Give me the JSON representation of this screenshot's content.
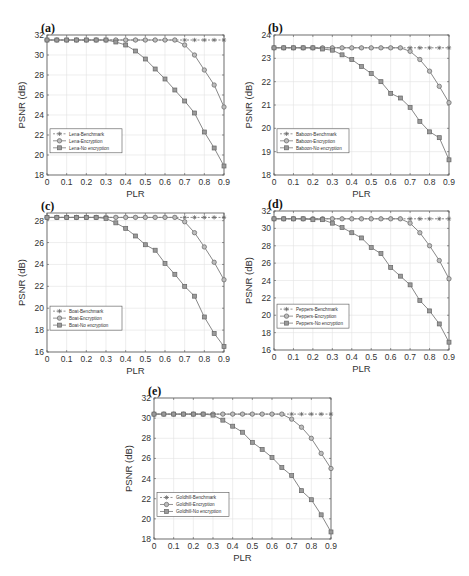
{
  "figure": {
    "xlabel": "PLR",
    "ylabel": "PSNR (dB)"
  },
  "chart_data": [
    {
      "panel": "(a)",
      "type": "line",
      "xlabel": "PLR",
      "ylabel": "PSNR (dB)",
      "x": [
        0,
        0.05,
        0.1,
        0.15,
        0.2,
        0.25,
        0.3,
        0.35,
        0.4,
        0.45,
        0.5,
        0.55,
        0.6,
        0.65,
        0.7,
        0.75,
        0.8,
        0.85,
        0.9
      ],
      "xticks": [
        "0",
        "0.1",
        "0.2",
        "0.3",
        "0.4",
        "0.5",
        "0.6",
        "0.7",
        "0.8",
        "0.9"
      ],
      "xlim": [
        0,
        0.9
      ],
      "ylim": [
        18,
        32
      ],
      "yticks": [
        18,
        20,
        22,
        24,
        26,
        28,
        30,
        32
      ],
      "grid": true,
      "legend_position": "lower left",
      "series": [
        {
          "name": "Lena-Benchmark",
          "marker": "star",
          "values": [
            31.5,
            31.5,
            31.5,
            31.5,
            31.5,
            31.5,
            31.5,
            31.5,
            31.5,
            31.5,
            31.5,
            31.5,
            31.5,
            31.5,
            31.5,
            31.5,
            31.5,
            31.5,
            31.5
          ]
        },
        {
          "name": "Lena-Encryption",
          "marker": "circle",
          "values": [
            31.5,
            31.5,
            31.5,
            31.5,
            31.5,
            31.5,
            31.5,
            31.5,
            31.5,
            31.5,
            31.5,
            31.5,
            31.5,
            31.5,
            31.0,
            30.0,
            28.5,
            27.0,
            24.8
          ]
        },
        {
          "name": "Lena-No encryption",
          "marker": "square",
          "values": [
            31.5,
            31.5,
            31.5,
            31.5,
            31.5,
            31.5,
            31.5,
            31.3,
            31.0,
            30.4,
            29.6,
            28.6,
            27.6,
            26.5,
            25.4,
            24.2,
            22.3,
            20.7,
            18.9
          ]
        }
      ]
    },
    {
      "panel": "(b)",
      "type": "line",
      "xlabel": "PLR",
      "ylabel": "PSNR (dB)",
      "x": [
        0,
        0.05,
        0.1,
        0.15,
        0.2,
        0.25,
        0.3,
        0.35,
        0.4,
        0.45,
        0.5,
        0.55,
        0.6,
        0.65,
        0.7,
        0.75,
        0.8,
        0.85,
        0.9
      ],
      "xticks": [
        "0",
        "0.1",
        "0.2",
        "0.3",
        "0.4",
        "0.5",
        "0.6",
        "0.7",
        "0.8",
        "0.9"
      ],
      "xlim": [
        0,
        0.9
      ],
      "ylim": [
        18,
        24
      ],
      "yticks": [
        18,
        19,
        20,
        21,
        22,
        23,
        24
      ],
      "grid": true,
      "legend_position": "lower left",
      "series": [
        {
          "name": "Baboon-Benchmark",
          "marker": "star",
          "values": [
            23.45,
            23.45,
            23.45,
            23.45,
            23.45,
            23.45,
            23.45,
            23.45,
            23.45,
            23.45,
            23.45,
            23.45,
            23.45,
            23.45,
            23.45,
            23.45,
            23.45,
            23.45,
            23.45
          ]
        },
        {
          "name": "Baboon-Encryption",
          "marker": "circle",
          "values": [
            23.45,
            23.45,
            23.45,
            23.45,
            23.45,
            23.45,
            23.45,
            23.45,
            23.45,
            23.45,
            23.45,
            23.45,
            23.45,
            23.45,
            23.3,
            22.95,
            22.45,
            21.8,
            21.1
          ]
        },
        {
          "name": "Baboon-No encryption",
          "marker": "square",
          "values": [
            23.45,
            23.45,
            23.45,
            23.45,
            23.45,
            23.4,
            23.35,
            23.15,
            22.95,
            22.65,
            22.35,
            22.0,
            21.5,
            21.3,
            20.9,
            20.3,
            19.85,
            19.6,
            18.65
          ]
        }
      ]
    },
    {
      "panel": "(c)",
      "type": "line",
      "xlabel": "PLR",
      "ylabel": "PSNR (dB)",
      "x": [
        0,
        0.05,
        0.1,
        0.15,
        0.2,
        0.25,
        0.3,
        0.35,
        0.4,
        0.45,
        0.5,
        0.55,
        0.6,
        0.65,
        0.7,
        0.75,
        0.8,
        0.85,
        0.9
      ],
      "xticks": [
        "0",
        "0.1",
        "0.2",
        "0.3",
        "0.4",
        "0.5",
        "0.6",
        "0.7",
        "0.8",
        "0.9"
      ],
      "xlim": [
        0,
        0.9
      ],
      "ylim": [
        16,
        28.7
      ],
      "yticks": [
        16,
        18,
        20,
        22,
        24,
        26,
        28
      ],
      "grid": true,
      "legend_position": "lower left",
      "series": [
        {
          "name": "Boat-Benchmark",
          "marker": "star",
          "values": [
            28.3,
            28.3,
            28.3,
            28.3,
            28.3,
            28.3,
            28.3,
            28.3,
            28.3,
            28.3,
            28.3,
            28.3,
            28.3,
            28.3,
            28.3,
            28.3,
            28.3,
            28.3,
            28.3
          ]
        },
        {
          "name": "Boat-Encryption",
          "marker": "circle",
          "values": [
            28.3,
            28.3,
            28.3,
            28.3,
            28.3,
            28.3,
            28.3,
            28.3,
            28.3,
            28.3,
            28.3,
            28.3,
            28.3,
            28.3,
            27.9,
            26.9,
            25.6,
            24.2,
            22.6
          ]
        },
        {
          "name": "Boat-No encryption",
          "marker": "square",
          "values": [
            28.3,
            28.3,
            28.3,
            28.3,
            28.3,
            28.3,
            28.2,
            27.8,
            27.3,
            26.6,
            25.8,
            25.3,
            24.1,
            23.1,
            22.0,
            21.1,
            19.2,
            17.7,
            16.5
          ]
        }
      ]
    },
    {
      "panel": "(d)",
      "type": "line",
      "xlabel": "PLR",
      "ylabel": "PSNR (dB)",
      "x": [
        0,
        0.05,
        0.1,
        0.15,
        0.2,
        0.25,
        0.3,
        0.35,
        0.4,
        0.45,
        0.5,
        0.55,
        0.6,
        0.65,
        0.7,
        0.75,
        0.8,
        0.85,
        0.9
      ],
      "xticks": [
        "0",
        "0.1",
        "0.2",
        "0.3",
        "0.4",
        "0.5",
        "0.6",
        "0.7",
        "0.8",
        "0.9"
      ],
      "xlim": [
        0,
        0.9
      ],
      "ylim": [
        16,
        32
      ],
      "yticks": [
        16,
        18,
        20,
        22,
        24,
        26,
        28,
        30,
        32
      ],
      "grid": true,
      "legend_position": "lower left",
      "series": [
        {
          "name": "Peppers-Benchmark",
          "marker": "star",
          "values": [
            31.1,
            31.1,
            31.1,
            31.1,
            31.1,
            31.1,
            31.1,
            31.1,
            31.1,
            31.1,
            31.1,
            31.1,
            31.1,
            31.1,
            31.1,
            31.1,
            31.1,
            31.1,
            31.1
          ]
        },
        {
          "name": "Peppers-Encryption",
          "marker": "circle",
          "values": [
            31.1,
            31.1,
            31.1,
            31.1,
            31.1,
            31.1,
            31.1,
            31.1,
            31.1,
            31.1,
            31.1,
            31.1,
            31.1,
            31.1,
            30.6,
            29.5,
            28.0,
            26.3,
            24.2
          ]
        },
        {
          "name": "Peppers-No encryption",
          "marker": "square",
          "values": [
            31.1,
            31.1,
            31.1,
            31.1,
            31.0,
            31.0,
            30.6,
            30.1,
            29.5,
            28.9,
            27.8,
            27.1,
            25.5,
            24.5,
            23.5,
            21.7,
            20.5,
            19.0,
            16.9
          ]
        }
      ]
    },
    {
      "panel": "(e)",
      "type": "line",
      "xlabel": "PLR",
      "ylabel": "PSNR (dB)",
      "x": [
        0,
        0.05,
        0.1,
        0.15,
        0.2,
        0.25,
        0.3,
        0.35,
        0.4,
        0.45,
        0.5,
        0.55,
        0.6,
        0.65,
        0.7,
        0.75,
        0.8,
        0.85,
        0.9
      ],
      "xticks": [
        "0",
        "0.1",
        "0.2",
        "0.3",
        "0.4",
        "0.5",
        "0.6",
        "0.7",
        "0.8",
        "0.9"
      ],
      "xlim": [
        0,
        0.9
      ],
      "ylim": [
        18,
        32
      ],
      "yticks": [
        18,
        20,
        22,
        24,
        26,
        28,
        30,
        32
      ],
      "grid": true,
      "legend_position": "lower left",
      "series": [
        {
          "name": "Goldhill-Benchmark",
          "marker": "star",
          "values": [
            30.4,
            30.4,
            30.4,
            30.4,
            30.4,
            30.4,
            30.4,
            30.4,
            30.4,
            30.4,
            30.4,
            30.4,
            30.4,
            30.4,
            30.4,
            30.4,
            30.4,
            30.4,
            30.4
          ]
        },
        {
          "name": "Goldhill-Encryption",
          "marker": "circle",
          "values": [
            30.4,
            30.4,
            30.4,
            30.4,
            30.4,
            30.4,
            30.4,
            30.4,
            30.4,
            30.4,
            30.4,
            30.4,
            30.4,
            30.4,
            29.9,
            29.1,
            28.0,
            26.5,
            25.0
          ]
        },
        {
          "name": "Goldhill-No encryption",
          "marker": "square",
          "values": [
            30.4,
            30.4,
            30.4,
            30.4,
            30.4,
            30.4,
            30.3,
            29.8,
            29.2,
            28.6,
            27.6,
            26.9,
            26.1,
            25.1,
            24.3,
            22.8,
            21.9,
            20.4,
            18.7
          ]
        }
      ]
    }
  ],
  "layout": {
    "panels": [
      {
        "left": 47,
        "top": 35,
        "width": 177,
        "height": 140
      },
      {
        "left": 274,
        "top": 35,
        "width": 175,
        "height": 140
      },
      {
        "left": 47,
        "top": 213,
        "width": 177,
        "height": 139
      },
      {
        "left": 274,
        "top": 211,
        "width": 175,
        "height": 139
      },
      {
        "left": 154,
        "top": 398,
        "width": 177,
        "height": 141
      }
    ],
    "colors": {
      "axis": "#555555",
      "grid": "#e2e2e2",
      "line": "#7a7a7a",
      "marker": "#666666",
      "text": "#333333"
    }
  }
}
